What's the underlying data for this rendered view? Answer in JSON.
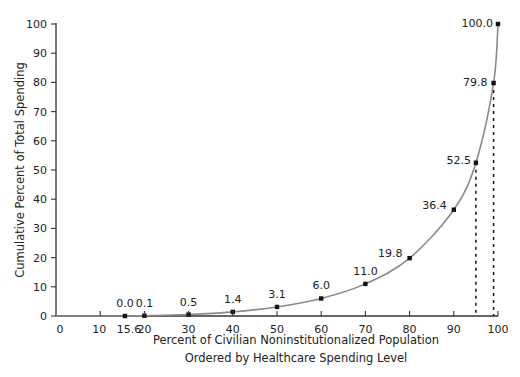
{
  "chart_data": {
    "type": "line",
    "title": "",
    "xlabel": "Percent of Civilian Noninstitutionalized Population",
    "xlabel_line2": "Ordered by Healthcare Spending Level",
    "ylabel": "Cumulative Percent of Total Spending",
    "xlim": [
      0,
      100
    ],
    "ylim": [
      0,
      100
    ],
    "grid": false,
    "legend": "none",
    "x_ticks": [
      0,
      10,
      15.6,
      20,
      30,
      40,
      50,
      60,
      70,
      80,
      90,
      100
    ],
    "x_tick_labels": [
      "0",
      "10",
      "15.6",
      "20",
      "30",
      "40",
      "50",
      "60",
      "70",
      "80",
      "90",
      "100"
    ],
    "y_ticks": [
      0,
      10,
      20,
      30,
      40,
      50,
      60,
      70,
      80,
      90,
      100
    ],
    "y_tick_labels": [
      "0",
      "10",
      "20",
      "30",
      "40",
      "50",
      "60",
      "70",
      "80",
      "90",
      "100"
    ],
    "series": [
      {
        "name": "Cumulative spending",
        "x": [
          15.6,
          20,
          30,
          40,
          50,
          60,
          70,
          80,
          90,
          95,
          99,
          100
        ],
        "values": [
          0.0,
          0.1,
          0.5,
          1.4,
          3.1,
          6.0,
          11.0,
          19.8,
          36.4,
          52.5,
          79.8,
          100.0
        ],
        "labels": [
          "0.0",
          "0.1",
          "0.5",
          "1.4",
          "3.1",
          "6.0",
          "11.0",
          "19.8",
          "36.4",
          "52.5",
          "79.8",
          "100.0"
        ]
      }
    ],
    "annotations": [
      {
        "type": "dashed-vertical",
        "x": 95,
        "from_y": 0,
        "to_y": 52.5
      },
      {
        "type": "dashed-vertical",
        "x": 99,
        "from_y": 0,
        "to_y": 79.8
      }
    ]
  },
  "colors": {
    "axis": "#333333",
    "curve": "#8a8a8a",
    "marker": "#111111",
    "text": "#222222"
  }
}
